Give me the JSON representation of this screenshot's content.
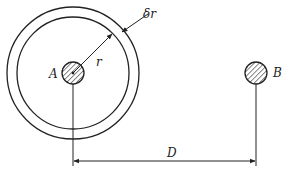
{
  "diagram": {
    "labels": {
      "point_a": "A",
      "point_b": "B",
      "radius": "r",
      "shell_thickness": "δr",
      "distance": "D"
    },
    "colors": {
      "stroke": "#222222",
      "background": "#ffffff"
    },
    "geometry": {
      "a_center": [
        73,
        73
      ],
      "b_center": [
        256,
        73
      ],
      "conductor_radius": 11,
      "inner_shell_radius": 56,
      "outer_shell_radius": 66,
      "dimension_line_y": 160
    }
  }
}
